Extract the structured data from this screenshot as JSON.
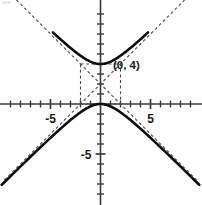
{
  "chart_data": {
    "type": "line",
    "title": "",
    "subtitle": "",
    "xlabel": "",
    "ylabel": "",
    "xlim": [
      -10,
      10
    ],
    "ylim": [
      -10.5,
      10
    ],
    "grid": false,
    "legend": null,
    "x_tick_labels": [
      {
        "value": -5,
        "text": "-5"
      },
      {
        "value": 5,
        "text": "5"
      }
    ],
    "y_tick_labels": [
      {
        "value": -5,
        "text": "-5"
      }
    ],
    "x_tick_values": [
      -9,
      -8,
      -7,
      -6,
      -5,
      -4,
      -3,
      -2,
      -1,
      1,
      2,
      3,
      4,
      5,
      6,
      7,
      8,
      9
    ],
    "y_tick_values": [
      -9,
      -8,
      -7,
      -6,
      -5,
      -4,
      -3,
      -2,
      -1,
      1,
      2,
      3,
      4,
      5,
      6,
      7,
      8,
      9
    ],
    "annotations": [
      {
        "text": "(0, 4)",
        "x": 0,
        "y": 4
      }
    ],
    "curve_description": "vertical hyperbola",
    "center": [
      0,
      2
    ],
    "a": 2,
    "b": 2,
    "vertices": [
      [
        0,
        4
      ],
      [
        0,
        0
      ]
    ],
    "series": [
      {
        "name": "upper-branch",
        "style": "solid",
        "points": [
          [
            -4.6,
            9.14
          ],
          [
            -4.2,
            8.64
          ],
          [
            -3.8,
            8.15
          ],
          [
            -3.4,
            7.67
          ],
          [
            -3.0,
            7.21
          ],
          [
            -2.6,
            6.77
          ],
          [
            -2.2,
            6.37
          ],
          [
            -1.8,
            6.02
          ],
          [
            -1.4,
            5.72
          ],
          [
            -1.0,
            5.47
          ],
          [
            -0.6,
            5.29
          ],
          [
            -0.3,
            5.2
          ],
          [
            0.0,
            4.0
          ],
          [
            0.3,
            5.2
          ],
          [
            0.6,
            5.29
          ],
          [
            1.0,
            5.47
          ],
          [
            1.4,
            5.72
          ],
          [
            1.8,
            6.02
          ],
          [
            2.2,
            6.37
          ],
          [
            2.6,
            6.77
          ],
          [
            3.0,
            7.21
          ],
          [
            3.4,
            7.67
          ],
          [
            3.8,
            8.15
          ],
          [
            4.2,
            8.64
          ],
          [
            4.6,
            9.14
          ]
        ]
      },
      {
        "name": "lower-branch",
        "style": "solid",
        "points": [
          [
            -9.5,
            -7.7
          ],
          [
            -8.0,
            -6.25
          ],
          [
            -6.5,
            -4.8
          ],
          [
            -5.0,
            -3.39
          ],
          [
            -3.5,
            -2.04
          ],
          [
            -2.0,
            -0.83
          ],
          [
            -1.0,
            -0.24
          ],
          [
            0.0,
            0.0
          ],
          [
            1.0,
            -0.24
          ],
          [
            2.0,
            -0.83
          ],
          [
            3.5,
            -2.04
          ],
          [
            5.0,
            -3.39
          ],
          [
            6.5,
            -4.8
          ],
          [
            8.0,
            -6.25
          ],
          [
            9.5,
            -7.7
          ]
        ]
      },
      {
        "name": "asymptote-positive-slope",
        "style": "dashed",
        "points": [
          [
            -9.6,
            -7.6
          ],
          [
            9.6,
            11.6
          ]
        ]
      },
      {
        "name": "asymptote-negative-slope",
        "style": "dashed",
        "points": [
          [
            -9.6,
            11.6
          ],
          [
            9.6,
            -7.6
          ]
        ]
      }
    ],
    "central_rectangle": {
      "x_min": -2,
      "x_max": 2,
      "y_min": 0,
      "y_max": 4
    },
    "colors": {
      "curve": "#0d0d0d",
      "asymptote": "#4a4a4a",
      "axis": "#3a3a3a",
      "background": "#ffffff",
      "label": "#1a1a1a"
    }
  }
}
